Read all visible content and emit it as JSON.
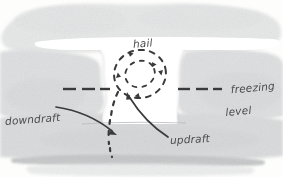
{
  "diagram": {
    "medium": "hand-drawn pencil and grey watercolour wash",
    "labels": {
      "hail": "hail",
      "freezing_line1": "freezing",
      "freezing_line2": "level",
      "downdraft": "downdraft",
      "updraft": "updraft"
    },
    "colors": {
      "paper": "#fdfdfc",
      "cloud_light": "#e9eaea",
      "cloud_mid": "#dcdddd",
      "cloud_dark": "#cfd0d1",
      "ground_band": "#c4c5c6",
      "ink": "#3a3a3a",
      "pencil_text": "#4a4a4a",
      "anvil_white": "#ffffff"
    },
    "elements": {
      "anvil_band": "white horizontal gap across cloud top",
      "updraft_column": "white vertical channel through cloud centre",
      "hail_loop": "dashed elliptical circulation with arrowheads",
      "hail_fall_trail": "dashed descending trail below loop",
      "freezing_level_line": "horizontal dashed line, broken at centre"
    }
  }
}
